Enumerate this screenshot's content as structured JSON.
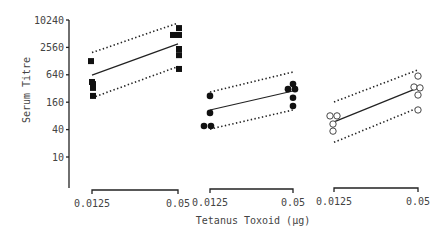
{
  "chart_data": {
    "type": "scatter",
    "title": "",
    "xlabel": "Tetanus Toxoid (µg)",
    "ylabel": "Serum Titre",
    "yscale": "log",
    "ylim": [
      2.5,
      12000
    ],
    "y_ticks": [
      10,
      40,
      160,
      640,
      2560,
      10240
    ],
    "y_tick_labels": [
      "10",
      "40",
      "160",
      "640",
      "2560",
      "10240"
    ],
    "x_tick_labels": [
      "0.0125",
      "0.05"
    ],
    "grid": false,
    "legend": null,
    "panels": [
      {
        "name": "group-1",
        "marker": "filled-square",
        "x": [
          0.0125,
          0.05
        ],
        "points": [
          {
            "x": 0.0125,
            "y": 1280
          },
          {
            "x": 0.0125,
            "y": 445
          },
          {
            "x": 0.0125,
            "y": 400
          },
          {
            "x": 0.0125,
            "y": 330
          },
          {
            "x": 0.0125,
            "y": 220
          },
          {
            "x": 0.05,
            "y": 6800
          },
          {
            "x": 0.05,
            "y": 4800
          },
          {
            "x": 0.05,
            "y": 4800
          },
          {
            "x": 0.05,
            "y": 2360
          },
          {
            "x": 0.05,
            "y": 1730
          },
          {
            "x": 0.05,
            "y": 860
          }
        ],
        "fit": [
          630,
          3050
        ],
        "upper_ci": [
          1970,
          8800
        ],
        "lower_ci": [
          200,
          970
        ]
      },
      {
        "name": "group-2",
        "marker": "filled-circle",
        "x": [
          0.0125,
          0.05
        ],
        "points": [
          {
            "x": 0.0125,
            "y": 220
          },
          {
            "x": 0.0125,
            "y": 93
          },
          {
            "x": 0.0125,
            "y": 48
          },
          {
            "x": 0.0125,
            "y": 48
          },
          {
            "x": 0.05,
            "y": 400
          },
          {
            "x": 0.05,
            "y": 310
          },
          {
            "x": 0.05,
            "y": 310
          },
          {
            "x": 0.05,
            "y": 200
          },
          {
            "x": 0.05,
            "y": 132
          }
        ],
        "fit": [
          108,
          282
        ],
        "upper_ci": [
          267,
          737
        ],
        "lower_ci": [
          41,
          108
        ]
      },
      {
        "name": "group-3",
        "marker": "open-circle",
        "x": [
          0.0125,
          0.05
        ],
        "points": [
          {
            "x": 0.0125,
            "y": 80
          },
          {
            "x": 0.0125,
            "y": 80
          },
          {
            "x": 0.0125,
            "y": 53
          },
          {
            "x": 0.0125,
            "y": 37
          },
          {
            "x": 0.05,
            "y": 600
          },
          {
            "x": 0.05,
            "y": 345
          },
          {
            "x": 0.05,
            "y": 330
          },
          {
            "x": 0.05,
            "y": 230
          },
          {
            "x": 0.05,
            "y": 108
          }
        ],
        "fit": [
          59,
          330
        ],
        "upper_ci": [
          162,
          820
        ],
        "lower_ci": [
          21,
          120
        ]
      }
    ]
  }
}
